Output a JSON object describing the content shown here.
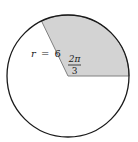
{
  "figure": {
    "type": "circle-sector-diagram",
    "radius_label": {
      "var": "r",
      "eq": "=",
      "value": "6"
    },
    "angle_label": {
      "numerator": "2π",
      "denominator": "3"
    },
    "colors": {
      "sector_fill": "#d3d3d3",
      "circle_stroke": "#1a1a1a",
      "sector_edge": "#808080",
      "background": "#ffffff"
    }
  }
}
